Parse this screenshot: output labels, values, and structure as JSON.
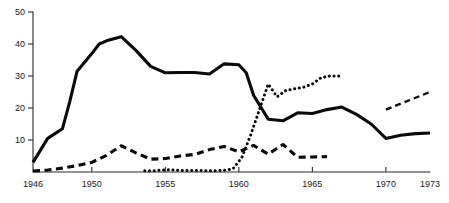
{
  "chart_data": {
    "type": "line",
    "title": "",
    "subtitle": "",
    "xlabel": "",
    "ylabel": "",
    "xlim": [
      1946,
      1973
    ],
    "ylim": [
      0,
      50
    ],
    "grid": false,
    "legend": "none",
    "x_ticks": [
      1946,
      1950,
      1955,
      1960,
      1965,
      1970,
      1973
    ],
    "x_tick_labels": [
      "1946",
      "1950",
      "1955",
      "1960",
      "1965",
      "1970",
      "1973"
    ],
    "y_ticks": [
      10,
      20,
      30,
      40,
      50
    ],
    "y_tick_labels": [
      "10",
      "20",
      "30",
      "40",
      "50"
    ],
    "series": [
      {
        "name": "solid-series",
        "style": "solid",
        "color": "#0a0a0a",
        "x": [
          1946,
          1947,
          1948,
          1948.5,
          1949,
          1950,
          1950.5,
          1951,
          1952,
          1953,
          1954,
          1955,
          1956,
          1957,
          1958,
          1959,
          1960,
          1960.5,
          1961,
          1962,
          1963,
          1964,
          1965,
          1966,
          1967,
          1968,
          1969,
          1970,
          1971,
          1972,
          1973
        ],
        "y": [
          3.0,
          10.5,
          13.5,
          22.0,
          31.5,
          37.0,
          40.0,
          41.0,
          42.3,
          38.0,
          33.0,
          31.0,
          31.1,
          31.1,
          30.6,
          33.8,
          33.5,
          31.0,
          24.0,
          16.5,
          16.0,
          18.5,
          18.3,
          19.5,
          20.3,
          18.0,
          15.0,
          10.5,
          11.5,
          12.0,
          12.2
        ]
      },
      {
        "name": "dashed-series",
        "style": "dashed",
        "color": "#0a0a0a",
        "x": [
          1946,
          1947,
          1948,
          1949,
          1950,
          1951,
          1952,
          1953,
          1954,
          1955,
          1956,
          1957,
          1958,
          1959,
          1960,
          1961,
          1962,
          1963,
          1964,
          1965,
          1966
        ],
        "y": [
          0.3,
          0.6,
          1.2,
          2.0,
          3.0,
          5.2,
          8.2,
          6.0,
          4.0,
          4.2,
          5.0,
          5.5,
          7.0,
          8.0,
          6.3,
          8.3,
          5.6,
          8.6,
          4.6,
          4.7,
          4.8
        ]
      },
      {
        "name": "dotted-series",
        "style": "dotted",
        "color": "#0a0a0a",
        "x": [
          1953.6,
          1954.2,
          1954.8,
          1955.4,
          1956.0,
          1958.4,
          1959.0,
          1959.6,
          1960.2,
          1960.8,
          1961.4,
          1962.0,
          1962.6,
          1963.2,
          1963.8,
          1964.4,
          1965.0,
          1965.6,
          1966.2,
          1966.8
        ],
        "y": [
          0.4,
          0.4,
          0.6,
          0.7,
          0.5,
          0.4,
          0.5,
          1.0,
          4.5,
          11.5,
          19.5,
          27.5,
          23.5,
          25.5,
          26.0,
          26.5,
          27.5,
          29.5,
          30.0,
          30.0
        ]
      },
      {
        "name": "dashed-short-series",
        "style": "dashed-short",
        "color": "#0a0a0a",
        "x": [
          1970,
          1973
        ],
        "y": [
          19.5,
          25.0
        ]
      }
    ]
  }
}
